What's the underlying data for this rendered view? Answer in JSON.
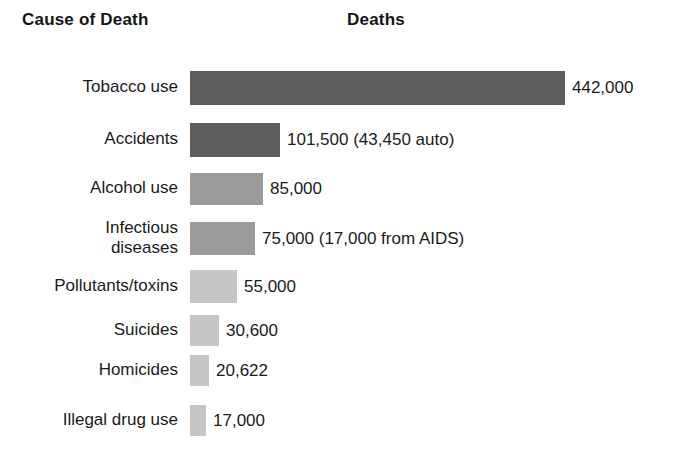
{
  "header": {
    "category_title": "Cause of Death",
    "value_title": "Deaths"
  },
  "chart_data": {
    "type": "bar",
    "orientation": "horizontal",
    "title": "",
    "xlabel": "Deaths",
    "ylabel": "Cause of Death",
    "grid": false,
    "legend": "none",
    "xlim": [
      0,
      442000
    ],
    "categories": [
      "Tobacco use",
      "Accidents",
      "Alcohol use",
      "Infectious\ndiseases",
      "Pollutants/toxins",
      "Suicides",
      "Homicides",
      "Illegal drug use"
    ],
    "values": [
      442000,
      101500,
      85000,
      75000,
      55000,
      30600,
      20622,
      17000
    ],
    "value_labels": [
      "442,000",
      "101,500 (43,450 auto)",
      "85,000",
      "75,000 (17,000 from AIDS)",
      "55,000",
      "30,600",
      "20,622",
      "17,000"
    ],
    "bar_colors": [
      "#5d5d5d",
      "#5d5d5d",
      "#9b9b9b",
      "#9b9b9b",
      "#c6c6c6",
      "#c6c6c6",
      "#c6c6c6",
      "#c6c6c6"
    ],
    "annotations": [
      "43,450 auto deaths included in Accidents",
      "17,000 from AIDS included in Infectious diseases"
    ]
  },
  "layout": {
    "bar_origin_x": 190,
    "bar_max_width": 375,
    "label_gap": 7,
    "rows": [
      {
        "top": 9,
        "height": 34,
        "bar_width": 375,
        "label_top": 14
      },
      {
        "top": 61,
        "height": 34,
        "bar_width": 90,
        "label_top": 66
      },
      {
        "top": 111,
        "height": 32,
        "bar_width": 73,
        "label_top": 115
      },
      {
        "top": 160,
        "height": 33,
        "bar_width": 65,
        "label_top": 172
      },
      {
        "top": 208,
        "height": 33,
        "bar_width": 47,
        "label_top": 213
      },
      {
        "top": 253,
        "height": 31,
        "bar_width": 29,
        "label_top": 257
      },
      {
        "top": 293,
        "height": 31,
        "bar_width": 19,
        "label_top": 297
      },
      {
        "top": 343,
        "height": 31,
        "bar_width": 16,
        "label_top": 347
      }
    ]
  }
}
